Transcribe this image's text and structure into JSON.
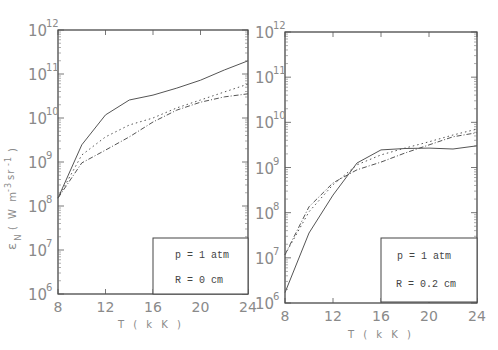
{
  "chart_data": [
    {
      "type": "line",
      "panel": "left",
      "title": "",
      "xlabel": "T ( k K )",
      "ylabel": "ε_N ( W m^-3 sr^-1 )",
      "yscale": "log",
      "xlim": [
        8,
        24
      ],
      "ylim": [
        1000000.0,
        1000000000000.0
      ],
      "x_ticks": [
        8,
        12,
        16,
        20,
        24
      ],
      "y_ticks": [
        "10^6",
        "10^7",
        "10^8",
        "10^9",
        "10^10",
        "10^11",
        "10^12"
      ],
      "grid": false,
      "annotation": [
        "p = 1 atm",
        "R = 0 cm"
      ],
      "x": [
        8,
        10,
        12,
        14,
        16,
        18,
        20,
        22,
        24
      ],
      "series": [
        {
          "name": "solid",
          "style": "solid",
          "log10_values": [
            8.18,
            9.39,
            10.07,
            10.41,
            10.52,
            10.68,
            10.86,
            11.09,
            11.3
          ]
        },
        {
          "name": "dotted",
          "style": "dotted",
          "log10_values": [
            8.18,
            9.16,
            9.57,
            9.84,
            10.0,
            10.23,
            10.41,
            10.59,
            10.77
          ]
        },
        {
          "name": "dash-dot",
          "style": "dashdot",
          "log10_values": [
            8.18,
            8.98,
            9.27,
            9.57,
            9.91,
            10.18,
            10.36,
            10.48,
            10.55
          ]
        }
      ]
    },
    {
      "type": "line",
      "panel": "right",
      "title": "",
      "xlabel": "T ( k K )",
      "ylabel": "",
      "yscale": "log",
      "xlim": [
        8,
        24
      ],
      "ylim": [
        1000000.0,
        1000000000000.0
      ],
      "x_ticks": [
        8,
        12,
        16,
        20,
        24
      ],
      "y_ticks": [
        "10^6",
        "10^7",
        "10^8",
        "10^9",
        "10^10",
        "10^11",
        "10^12"
      ],
      "grid": false,
      "annotation": [
        "p = 1 atm",
        "R = 0.2 cm"
      ],
      "x": [
        8,
        10,
        12,
        14,
        16,
        18,
        20,
        22,
        24
      ],
      "series": [
        {
          "name": "solid",
          "style": "solid",
          "log10_values": [
            6.23,
            7.55,
            8.39,
            9.1,
            9.39,
            9.42,
            9.43,
            9.41,
            9.48
          ]
        },
        {
          "name": "dotted",
          "style": "dotted",
          "log10_values": [
            7.07,
            8.02,
            8.62,
            9.06,
            9.28,
            9.43,
            9.57,
            9.72,
            9.85
          ]
        },
        {
          "name": "dash-dot",
          "style": "dashdot",
          "log10_values": [
            7.07,
            8.13,
            8.66,
            8.95,
            9.12,
            9.32,
            9.5,
            9.68,
            9.77
          ]
        }
      ]
    }
  ],
  "labels": {
    "ylabel_main": "ε",
    "ylabel_sub": "N",
    "ylabel_units": "( W m",
    "ylabel_exp1": "-3",
    "ylabel_sr": "sr",
    "ylabel_exp2": "-1",
    "ylabel_close": ")",
    "xlabel": "T ( k K )",
    "tick_base": "10",
    "y_exponents": [
      "6",
      "7",
      "8",
      "9",
      "10",
      "11",
      "12"
    ],
    "x_ticks": [
      "8",
      "12",
      "16",
      "20",
      "24"
    ]
  },
  "legend_left": {
    "line1": "p = 1 atm",
    "line2": "R = 0 cm"
  },
  "legend_right": {
    "line1": "p = 1 atm",
    "line2": "R = 0.2 cm"
  }
}
